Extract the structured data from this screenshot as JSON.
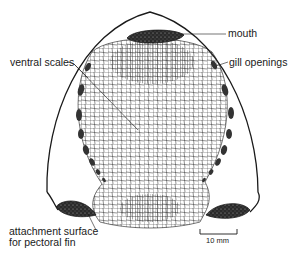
{
  "figure": {
    "colors": {
      "stroke": "#1a1a1a",
      "mesh": "#3a3a3a",
      "fill_dark": "#2a2a2a",
      "background": "#ffffff"
    }
  },
  "labels": {
    "mouth": "mouth",
    "gill_openings": "gill openings",
    "ventral_scales": "ventral scales",
    "attachment_line1": "attachment surface",
    "attachment_line2": "for pectoral fin"
  },
  "scale_bar": {
    "label": "10 mm"
  }
}
